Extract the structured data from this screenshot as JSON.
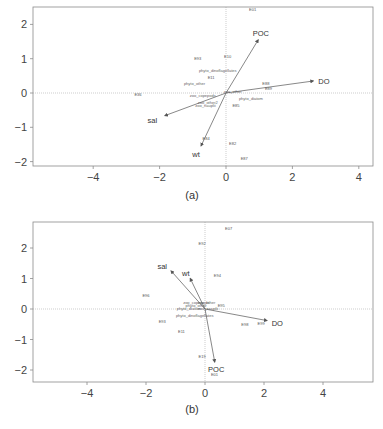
{
  "figure": {
    "panels": [
      {
        "id": "a",
        "caption": "(a)",
        "frame": {
          "x": 33,
          "y": 7,
          "w": 340,
          "h": 159
        },
        "origin_px": {
          "x": 226,
          "y": 93
        },
        "scale_px": {
          "x": 33.2,
          "y": 34.3
        },
        "x_ticks": [
          {
            "v": -4,
            "label": "−4"
          },
          {
            "v": -2,
            "label": "−2"
          },
          {
            "v": 0,
            "label": "0"
          },
          {
            "v": 2,
            "label": "2"
          },
          {
            "v": 4,
            "label": "4"
          }
        ],
        "y_ticks": [
          {
            "v": 2,
            "label": "2"
          },
          {
            "v": 1,
            "label": "1"
          },
          {
            "v": 0,
            "label": "0"
          },
          {
            "v": -1,
            "label": "−1"
          },
          {
            "v": -2,
            "label": "−2"
          }
        ],
        "arrows": [
          {
            "label": "POC",
            "x": 0.97,
            "y": 1.55,
            "lx": 1.05,
            "ly": 1.75
          },
          {
            "label": "DO",
            "x": 2.63,
            "y": 0.35,
            "lx": 2.95,
            "ly": 0.35
          },
          {
            "label": "sal",
            "x": -1.84,
            "y": -0.66,
            "lx": -2.22,
            "ly": -0.78
          },
          {
            "label": "wt",
            "x": -0.75,
            "y": -1.54,
            "lx": -0.9,
            "ly": -1.78
          }
        ],
        "sites": [
          {
            "label": "E01",
            "x": 0.8,
            "y": 2.4
          },
          {
            "label": "E93",
            "x": -0.85,
            "y": 0.97
          },
          {
            "label": "E10",
            "x": 0.05,
            "y": 1.02
          },
          {
            "label": "E11",
            "x": -0.45,
            "y": 0.4
          },
          {
            "label": "E36",
            "x": -2.65,
            "y": -0.1
          },
          {
            "label": "E88",
            "x": 1.2,
            "y": 0.22
          },
          {
            "label": "E89",
            "x": 1.28,
            "y": 0.1
          },
          {
            "label": "E85",
            "x": 0.3,
            "y": -0.4
          },
          {
            "label": "E84",
            "x": -0.6,
            "y": -1.38
          },
          {
            "label": "E82",
            "x": 0.2,
            "y": -1.52
          },
          {
            "label": "E87",
            "x": 0.55,
            "y": -1.95
          }
        ],
        "species": [
          {
            "label": "phyto_dinoflagellates",
            "x": -0.25,
            "y": 0.6
          },
          {
            "label": "phyto_other",
            "x": -0.95,
            "y": 0.22
          },
          {
            "label": "zoo_copepods",
            "x": -0.7,
            "y": -0.12
          },
          {
            "label": "zoo_other",
            "x": 0.2,
            "y": 0.01
          },
          {
            "label": "phyto_diatom",
            "x": 0.75,
            "y": -0.2
          },
          {
            "label": "zoo_other2",
            "x": -0.55,
            "y": -0.33
          },
          {
            "label": "zoo_nauplii",
            "x": -0.62,
            "y": -0.4
          }
        ],
        "caption_pos": {
          "x": 192,
          "y": 199
        }
      },
      {
        "id": "b",
        "caption": "(b)",
        "frame": {
          "x": 33,
          "y": 222,
          "w": 340,
          "h": 160
        },
        "origin_px": {
          "x": 205,
          "y": 309
        },
        "scale_px": {
          "x": 29.5,
          "y": 30.5
        },
        "x_ticks": [
          {
            "v": -4,
            "label": "−4"
          },
          {
            "v": -2,
            "label": "−2"
          },
          {
            "v": 0,
            "label": "0"
          },
          {
            "v": 2,
            "label": "2"
          },
          {
            "v": 4,
            "label": "4"
          }
        ],
        "y_ticks": [
          {
            "v": 2,
            "label": "2"
          },
          {
            "v": 1,
            "label": "1"
          },
          {
            "v": 0,
            "label": "0"
          },
          {
            "v": -1,
            "label": "−1"
          },
          {
            "v": -2,
            "label": "−2"
          }
        ],
        "arrows": [
          {
            "label": "sal",
            "x": -1.15,
            "y": 1.25,
            "lx": -1.45,
            "ly": 1.4
          },
          {
            "label": "wt",
            "x": -0.5,
            "y": 1.0,
            "lx": -0.65,
            "ly": 1.18
          },
          {
            "label": "DO",
            "x": 2.1,
            "y": -0.38,
            "lx": 2.45,
            "ly": -0.45
          },
          {
            "label": "POC",
            "x": 0.33,
            "y": -1.74,
            "lx": 0.38,
            "ly": -1.98
          }
        ],
        "sites": [
          {
            "label": "E07",
            "x": 0.8,
            "y": 2.6
          },
          {
            "label": "E92",
            "x": -0.1,
            "y": 2.1
          },
          {
            "label": "E94",
            "x": 0.42,
            "y": 1.05
          },
          {
            "label": "E96",
            "x": -2.0,
            "y": 0.38
          },
          {
            "label": "E95",
            "x": 0.55,
            "y": 0.05
          },
          {
            "label": "E93",
            "x": -1.45,
            "y": -0.45
          },
          {
            "label": "E11",
            "x": -0.8,
            "y": -0.78
          },
          {
            "label": "E98",
            "x": 1.35,
            "y": -0.55
          },
          {
            "label": "E99",
            "x": 1.9,
            "y": -0.52
          },
          {
            "label": "E19",
            "x": -0.1,
            "y": -1.62
          },
          {
            "label": "E01",
            "x": 0.32,
            "y": -2.2
          }
        ],
        "species": [
          {
            "label": "zoo_copepods",
            "x": -0.3,
            "y": 0.18
          },
          {
            "label": "zoo_other",
            "x": 0.05,
            "y": 0.15
          },
          {
            "label": "phyto_other",
            "x": -0.3,
            "y": 0.05
          },
          {
            "label": "phyto_diatom",
            "x": -0.55,
            "y": -0.03
          },
          {
            "label": "zoo_nauplii",
            "x": 0.1,
            "y": -0.02
          },
          {
            "label": "phyto_dinoflagellates",
            "x": -0.35,
            "y": -0.25
          }
        ],
        "caption_pos": {
          "x": 192,
          "y": 413
        }
      }
    ]
  },
  "chart_data": [
    {
      "type": "scatter",
      "title": "(a)",
      "xlabel": "",
      "ylabel": "",
      "xlim": [
        -5.8,
        4.4
      ],
      "ylim": [
        -2.1,
        2.5
      ],
      "x_ticks": [
        -4,
        -2,
        0,
        2,
        4
      ],
      "y_ticks": [
        -2,
        -1,
        0,
        1,
        2
      ],
      "grid": false,
      "reference_lines": {
        "x": 0,
        "y": 0,
        "style": "dotted"
      },
      "arrows": [
        {
          "name": "POC",
          "x": 0.97,
          "y": 1.55
        },
        {
          "name": "DO",
          "x": 2.63,
          "y": 0.35
        },
        {
          "name": "sal",
          "x": -1.84,
          "y": -0.66
        },
        {
          "name": "wt",
          "x": -0.75,
          "y": -1.54
        }
      ],
      "series": [
        {
          "name": "sites",
          "points": [
            {
              "label": "E01",
              "x": 0.8,
              "y": 2.4
            },
            {
              "label": "E93",
              "x": -0.85,
              "y": 0.97
            },
            {
              "label": "E10",
              "x": 0.05,
              "y": 1.02
            },
            {
              "label": "E11",
              "x": -0.45,
              "y": 0.4
            },
            {
              "label": "E36",
              "x": -2.65,
              "y": -0.1
            },
            {
              "label": "E88",
              "x": 1.2,
              "y": 0.22
            },
            {
              "label": "E89",
              "x": 1.28,
              "y": 0.1
            },
            {
              "label": "E85",
              "x": 0.3,
              "y": -0.4
            },
            {
              "label": "E84",
              "x": -0.6,
              "y": -1.38
            },
            {
              "label": "E82",
              "x": 0.2,
              "y": -1.52
            },
            {
              "label": "E87",
              "x": 0.55,
              "y": -1.95
            }
          ]
        },
        {
          "name": "species",
          "points": [
            {
              "label": "phyto_dinoflagellates",
              "x": -0.25,
              "y": 0.6
            },
            {
              "label": "phyto_other",
              "x": -0.95,
              "y": 0.22
            },
            {
              "label": "zoo_copepods",
              "x": -0.7,
              "y": -0.12
            },
            {
              "label": "zoo_other",
              "x": 0.2,
              "y": 0.01
            },
            {
              "label": "phyto_diatom",
              "x": 0.75,
              "y": -0.2
            },
            {
              "label": "zoo_nauplii",
              "x": -0.62,
              "y": -0.4
            }
          ]
        }
      ]
    },
    {
      "type": "scatter",
      "title": "(b)",
      "xlabel": "",
      "ylabel": "",
      "xlim": [
        -5.8,
        5.7
      ],
      "ylim": [
        -2.4,
        2.9
      ],
      "x_ticks": [
        -4,
        -2,
        0,
        2,
        4
      ],
      "y_ticks": [
        -2,
        -1,
        0,
        1,
        2
      ],
      "grid": false,
      "reference_lines": {
        "x": 0,
        "y": 0,
        "style": "dotted"
      },
      "arrows": [
        {
          "name": "sal",
          "x": -1.15,
          "y": 1.25
        },
        {
          "name": "wt",
          "x": -0.5,
          "y": 1.0
        },
        {
          "name": "DO",
          "x": 2.1,
          "y": -0.38
        },
        {
          "name": "POC",
          "x": 0.33,
          "y": -1.74
        }
      ],
      "series": [
        {
          "name": "sites",
          "points": [
            {
              "label": "E07",
              "x": 0.8,
              "y": 2.6
            },
            {
              "label": "E92",
              "x": -0.1,
              "y": 2.1
            },
            {
              "label": "E94",
              "x": 0.42,
              "y": 1.05
            },
            {
              "label": "E96",
              "x": -2.0,
              "y": 0.38
            },
            {
              "label": "E95",
              "x": 0.55,
              "y": 0.05
            },
            {
              "label": "E93",
              "x": -1.45,
              "y": -0.45
            },
            {
              "label": "E11",
              "x": -0.8,
              "y": -0.78
            },
            {
              "label": "E98",
              "x": 1.35,
              "y": -0.55
            },
            {
              "label": "E99",
              "x": 1.9,
              "y": -0.52
            },
            {
              "label": "E19",
              "x": -0.1,
              "y": -1.62
            },
            {
              "label": "E01",
              "x": 0.32,
              "y": -2.2
            }
          ]
        },
        {
          "name": "species",
          "points": [
            {
              "label": "zoo_copepods",
              "x": -0.3,
              "y": 0.18
            },
            {
              "label": "zoo_other",
              "x": 0.05,
              "y": 0.15
            },
            {
              "label": "phyto_other",
              "x": -0.3,
              "y": 0.05
            },
            {
              "label": "phyto_diatom",
              "x": -0.55,
              "y": -0.03
            },
            {
              "label": "zoo_nauplii",
              "x": 0.1,
              "y": -0.02
            },
            {
              "label": "phyto_dinoflagellates",
              "x": -0.35,
              "y": -0.25
            }
          ]
        }
      ]
    }
  ],
  "colors": {
    "frame": "#8a8a8a",
    "axis_text": "#444444",
    "arrow": "#555555",
    "zero_line": "#9a9a9a",
    "site_text": "#555555",
    "species_text": "#777777"
  }
}
